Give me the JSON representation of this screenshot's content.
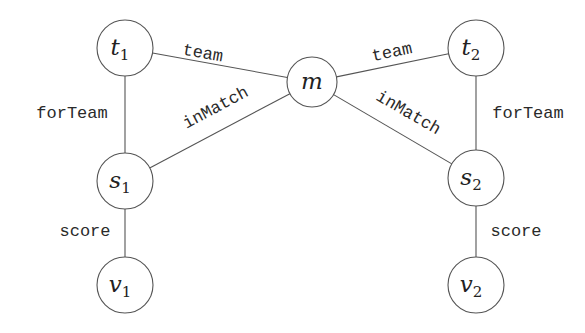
{
  "diagram": {
    "type": "graph",
    "colors": {
      "stroke": "#555555",
      "text": "#222222",
      "background": "#ffffff"
    },
    "nodes": [
      {
        "id": "t1",
        "base": "t",
        "sub": "1",
        "cx": 125,
        "cy": 48,
        "r": 28
      },
      {
        "id": "m",
        "base": "m",
        "sub": "",
        "cx": 312,
        "cy": 82,
        "r": 25
      },
      {
        "id": "t2",
        "base": "t",
        "sub": "2",
        "cx": 476,
        "cy": 48,
        "r": 28
      },
      {
        "id": "s1",
        "base": "s",
        "sub": "1",
        "cx": 125,
        "cy": 181,
        "r": 28
      },
      {
        "id": "s2",
        "base": "s",
        "sub": "2",
        "cx": 476,
        "cy": 178,
        "r": 28
      },
      {
        "id": "v1",
        "base": "v",
        "sub": "1",
        "cx": 125,
        "cy": 285,
        "r": 28
      },
      {
        "id": "v2",
        "base": "v",
        "sub": "2",
        "cx": 476,
        "cy": 285,
        "r": 28
      }
    ],
    "edges": [
      {
        "from": "t1",
        "to": "m",
        "label": "team",
        "lx": 202,
        "ly": 58,
        "rot": 10
      },
      {
        "from": "s1",
        "to": "m",
        "label": "inMatch",
        "lx": 218,
        "ly": 112,
        "rot": -28
      },
      {
        "from": "t1",
        "to": "s1",
        "label": "forTeam",
        "lx": 72,
        "ly": 118,
        "rot": 0
      },
      {
        "from": "s1",
        "to": "v1",
        "label": "score",
        "lx": 85,
        "ly": 236,
        "rot": 0
      },
      {
        "from": "m",
        "to": "t2",
        "label": "team",
        "lx": 393,
        "ly": 57,
        "rot": -12
      },
      {
        "from": "m",
        "to": "s2",
        "label": "inMatch",
        "lx": 406,
        "ly": 117,
        "rot": 30
      },
      {
        "from": "t2",
        "to": "s2",
        "label": "forTeam",
        "lx": 528,
        "ly": 118,
        "rot": 0
      },
      {
        "from": "s2",
        "to": "v2",
        "label": "score",
        "lx": 516,
        "ly": 236,
        "rot": 0
      }
    ]
  }
}
